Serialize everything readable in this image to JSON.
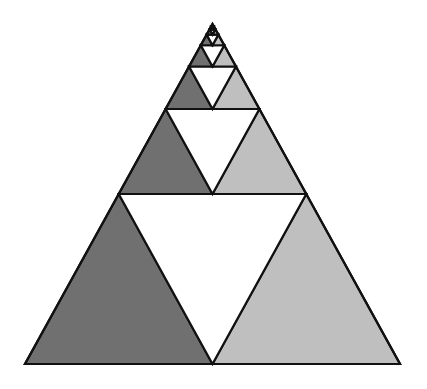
{
  "diagram": {
    "title": "",
    "type": "recursive-triangle-subdivision",
    "apex": [
      212.5,
      24
    ],
    "base_y": 364,
    "base_left_x": 25,
    "base_right_x": 400,
    "levels": 7,
    "colors": {
      "background": "#ffffff",
      "left_triangle": "#707070",
      "right_triangle": "#bfbfbf",
      "center_triangle": "#ffffff",
      "stroke": "#111111"
    },
    "stroke_width": 2.2
  }
}
